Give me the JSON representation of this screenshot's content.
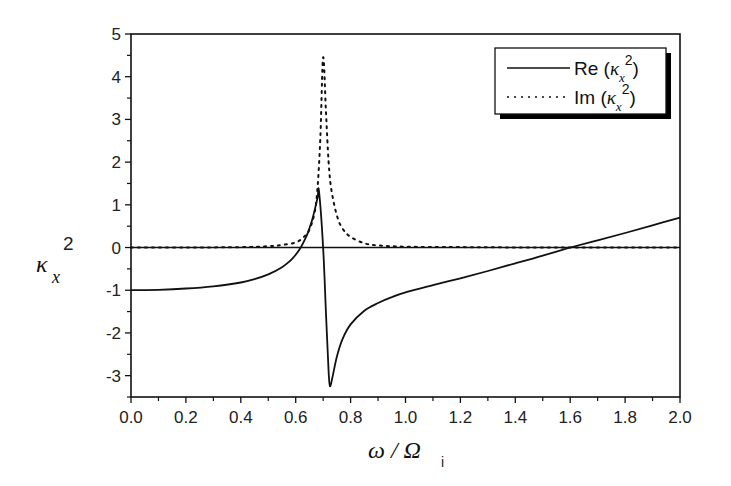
{
  "chart_data": {
    "type": "line",
    "title": "",
    "xlabel": "ω / Ω_i",
    "ylabel": "κ_x^2",
    "xlim": [
      0.0,
      2.0
    ],
    "ylim": [
      -3.5,
      5.0
    ],
    "xticks": [
      "0.0",
      "0.2",
      "0.4",
      "0.6",
      "0.8",
      "1.0",
      "1.2",
      "1.4",
      "1.6",
      "1.8",
      "2.0"
    ],
    "yticks": [
      "-3",
      "-2",
      "-1",
      "0",
      "1",
      "2",
      "3",
      "4",
      "5"
    ],
    "grid": false,
    "legend_position": "upper right",
    "zero_line": true,
    "series": [
      {
        "name": "Re (κ_x^2)",
        "style": "solid",
        "x": [
          0.0,
          0.1,
          0.2,
          0.3,
          0.4,
          0.45,
          0.5,
          0.55,
          0.58,
          0.6,
          0.62,
          0.64,
          0.65,
          0.66,
          0.67,
          0.68,
          0.685,
          0.7,
          0.71,
          0.72,
          0.725,
          0.735,
          0.75,
          0.77,
          0.8,
          0.85,
          0.9,
          0.95,
          1.0,
          1.1,
          1.2,
          1.3,
          1.4,
          1.5,
          1.6,
          1.7,
          1.8,
          1.9,
          2.0
        ],
        "y": [
          -1.0,
          -0.99,
          -0.96,
          -0.91,
          -0.82,
          -0.74,
          -0.63,
          -0.46,
          -0.31,
          -0.17,
          0.02,
          0.28,
          0.45,
          0.65,
          0.9,
          1.18,
          1.32,
          0.0,
          -1.5,
          -2.9,
          -3.25,
          -3.0,
          -2.55,
          -2.15,
          -1.8,
          -1.48,
          -1.3,
          -1.16,
          -1.05,
          -0.88,
          -0.72,
          -0.55,
          -0.37,
          -0.19,
          0.0,
          0.17,
          0.34,
          0.52,
          0.7
        ]
      },
      {
        "name": "Im (κ_x^2)",
        "style": "dotted",
        "x": [
          0.0,
          0.2,
          0.4,
          0.5,
          0.55,
          0.6,
          0.63,
          0.65,
          0.67,
          0.68,
          0.69,
          0.7,
          0.71,
          0.72,
          0.73,
          0.75,
          0.77,
          0.8,
          0.85,
          0.9,
          1.0,
          1.2,
          1.5,
          2.0
        ],
        "y": [
          0.0,
          0.0,
          0.01,
          0.03,
          0.06,
          0.12,
          0.25,
          0.42,
          0.85,
          1.45,
          2.6,
          4.45,
          3.2,
          2.0,
          1.35,
          0.75,
          0.45,
          0.25,
          0.1,
          0.05,
          0.02,
          0.01,
          0.0,
          0.0
        ]
      }
    ]
  },
  "axes": {
    "x_title_main": "ω / Ω",
    "x_title_sub": "i",
    "y_title_main": "κ",
    "y_title_sub": "x",
    "y_title_sup": "2"
  },
  "legend": {
    "items": [
      {
        "prefix": "Re (",
        "greek": "κ",
        "sub": "x",
        "sup": "2",
        "suffix": ")",
        "style": "solid"
      },
      {
        "prefix": "Im (",
        "greek": "κ",
        "sub": "x",
        "sup": "2",
        "suffix": ")",
        "style": "dotted"
      }
    ]
  },
  "colors": {
    "line": "#111111",
    "axis": "#111111",
    "background": "#ffffff"
  }
}
